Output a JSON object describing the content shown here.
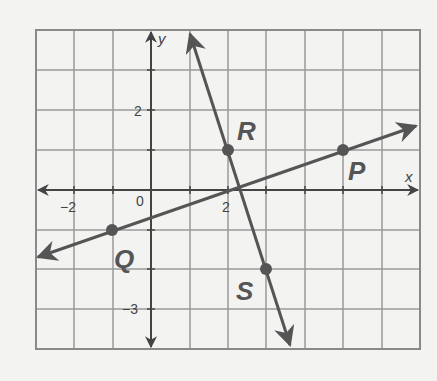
{
  "graph": {
    "axes": {
      "x_label": "x",
      "y_label": "y"
    },
    "tick_labels": {
      "x": [
        {
          "value": -2,
          "text": "−2"
        },
        {
          "value": 0,
          "text": "0"
        },
        {
          "value": 2,
          "text": "2"
        }
      ],
      "y": [
        {
          "value": 2,
          "text": "2"
        },
        {
          "value": -3,
          "text": "−3"
        }
      ]
    },
    "points": [
      {
        "name": "P",
        "x": 5,
        "y": 1
      },
      {
        "name": "Q",
        "x": -1,
        "y": -1
      },
      {
        "name": "R",
        "x": 2,
        "y": 1
      },
      {
        "name": "S",
        "x": 3,
        "y": -2
      }
    ],
    "lines": [
      {
        "name": "line-PQ",
        "through": [
          "Q",
          "P"
        ]
      },
      {
        "name": "line-RS",
        "through": [
          "R",
          "S"
        ]
      }
    ],
    "colors": {
      "line": "#555555",
      "grid": "#9a9a9a",
      "axis": "#444444",
      "background": "#f3f3f1"
    }
  }
}
